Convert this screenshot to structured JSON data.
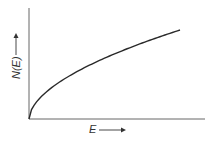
{
  "chart_data": {
    "type": "line",
    "title": "",
    "xlabel": "E",
    "ylabel": "N(E)",
    "x_arrow": true,
    "y_arrow": true,
    "grid": false,
    "ticks": false,
    "series": [
      {
        "name": "N(E)",
        "x": [
          0,
          0.1,
          0.2,
          0.3,
          0.4,
          0.5,
          0.6,
          0.7,
          0.8,
          0.9,
          1.0
        ],
        "values": [
          0,
          0.32,
          0.45,
          0.55,
          0.63,
          0.71,
          0.77,
          0.84,
          0.89,
          0.95,
          1.0
        ]
      }
    ]
  },
  "axes": {
    "xlabel": "E",
    "ylabel": "N(E)"
  },
  "colors": {
    "axis": "#555555",
    "curve": "#2a2a2a",
    "background": "#ffffff"
  }
}
